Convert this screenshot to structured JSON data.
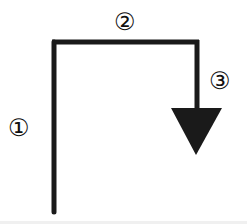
{
  "diagram": {
    "type": "stroke-order",
    "strokes": [
      {
        "number": 1,
        "label": "①",
        "direction": "vertical"
      },
      {
        "number": 2,
        "label": "②",
        "direction": "horizontal"
      },
      {
        "number": 3,
        "label": "③",
        "direction": "down-with-arrow"
      }
    ],
    "colors": {
      "stroke": "#1a1a1a",
      "background": "#ffffff"
    }
  }
}
